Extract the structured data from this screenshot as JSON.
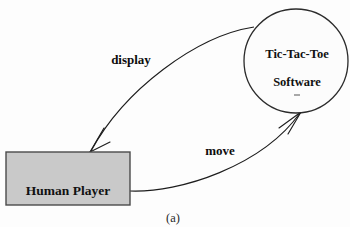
{
  "figure": {
    "caption": "(a)",
    "background_color": "#fdfdfd"
  },
  "nodes": [
    {
      "id": "human-player",
      "shape": "rectangle",
      "label": "Human Player",
      "fill_color": "#c9c9c9",
      "border_color": "#4a4a4a"
    },
    {
      "id": "tic-tac-toe-software",
      "shape": "circle",
      "label_line_1": "Tic-Tac-Toe",
      "label_line_2": "Software",
      "fill_color": "#fcfcfc",
      "border_color": "#2b2b2b"
    }
  ],
  "edges": [
    {
      "id": "display-edge",
      "label": "display",
      "from": "tic-tac-toe-software",
      "to": "human-player",
      "stroke_color": "#1d1d1d"
    },
    {
      "id": "move-edge",
      "label": "move",
      "from": "human-player",
      "to": "tic-tac-toe-software",
      "stroke_color": "#1d1d1d"
    }
  ]
}
